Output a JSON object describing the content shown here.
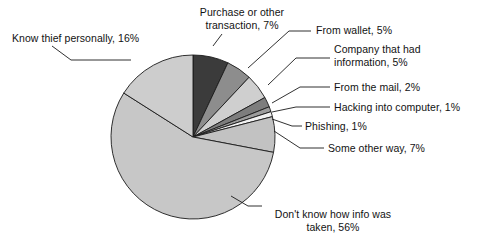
{
  "chart_data": {
    "type": "pie",
    "title": "",
    "subtitle": "",
    "xlabel": "",
    "ylabel": "",
    "legend_position": "none",
    "labels_style": "callout labels with leader lines",
    "units": "percent",
    "total": 100,
    "categories": [
      "Purchase or other transaction",
      "From wallet",
      "Company that had information",
      "From the mail",
      "Hacking into computer",
      "Phishing",
      "Some other way",
      "Don't know how info was taken",
      "Know thief personally"
    ],
    "values": [
      7,
      5,
      5,
      2,
      1,
      1,
      7,
      56,
      16
    ],
    "slice_colors": [
      "#3b3b3b",
      "#8d8d8d",
      "#cfcfcf",
      "#7d7d7d",
      "#9d9d9d",
      "#f2f2f2",
      "#c2c2c2",
      "#c7c7c7",
      "#cdcdcd"
    ],
    "slices": [
      {
        "label": "Purchase or other transaction",
        "value": 7,
        "color": "#3b3b3b"
      },
      {
        "label": "From wallet",
        "value": 5,
        "color": "#8d8d8d"
      },
      {
        "label": "Company that had information",
        "value": 5,
        "color": "#cfcfcf"
      },
      {
        "label": "From the mail",
        "value": 2,
        "color": "#7d7d7d"
      },
      {
        "label": "Hacking into computer",
        "value": 1,
        "color": "#9d9d9d"
      },
      {
        "label": "Phishing",
        "value": 1,
        "color": "#f2f2f2"
      },
      {
        "label": "Some other way",
        "value": 7,
        "color": "#c2c2c2"
      },
      {
        "label": "Don't know how info was taken",
        "value": 56,
        "color": "#c7c7c7"
      },
      {
        "label": "Know thief personally",
        "value": 16,
        "color": "#cdcdcd"
      }
    ]
  },
  "callouts": {
    "know_thief": "Know thief personally, 16%",
    "purchase_line1": "Purchase or other",
    "purchase_line2": "transaction, 7%",
    "from_wallet": "From wallet, 5%",
    "company_line1": "Company that had",
    "company_line2": "information, 5%",
    "from_mail": "From the mail, 2%",
    "hacking": "Hacking into computer, 1%",
    "phishing": "Phishing, 1%",
    "some_other_way": "Some other way, 7%",
    "dont_know_line1": "Don't know how info was",
    "dont_know_line2": "taken, 56%"
  },
  "style": {
    "background": "#ffffff",
    "stroke": "#1a1a1a",
    "text_color": "#121212"
  }
}
